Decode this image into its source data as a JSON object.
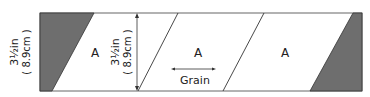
{
  "diagram": {
    "type": "quilt-cutting-strip",
    "strip_height_label": {
      "imperial": "3½in",
      "metric": "( 8.9cm )"
    },
    "inner_height_label": {
      "imperial": "3½in",
      "metric": "( 8.9cm )"
    },
    "pieces": [
      {
        "label": "A"
      },
      {
        "label": "A"
      },
      {
        "label": "A"
      }
    ],
    "grain_label": "Grain",
    "colors": {
      "waste_fill": "#6e6e6e",
      "outline": "#555555",
      "background": "#ffffff"
    }
  }
}
